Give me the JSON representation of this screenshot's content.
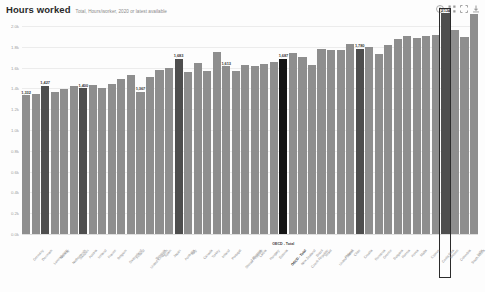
{
  "header": {
    "title": "Hours worked",
    "subtitle": "Total, Hours/worker, 2020 or latest available"
  },
  "toolbar": {
    "items": [
      {
        "name": "info-icon",
        "label": "Info"
      },
      {
        "name": "settings-icon",
        "label": "Settings"
      },
      {
        "name": "fullscreen-icon",
        "label": "Fullscreen"
      },
      {
        "name": "download-icon",
        "label": "Download"
      }
    ]
  },
  "annotations": {
    "oecd_marker": "OECD - Total",
    "selected_country": "Mexico"
  },
  "colors": {
    "bar": "#8e8e8e",
    "bar_highlight": "#4e4e4e",
    "bar_average": "#141414",
    "selection_border": "#2b2b2b",
    "grid": "#ececec",
    "axis_text": "#9d9d9d"
  },
  "chart_data": {
    "type": "bar",
    "title": "Hours worked",
    "subtitle": "Total, Hours/worker, 2020 or latest available",
    "xlabel": "",
    "ylabel": "Hours per worker",
    "ylim": [
      0,
      2000
    ],
    "grid": true,
    "legend": false,
    "ytick_labels": [
      "0.0k",
      "0.2k",
      "0.4k",
      "0.6k",
      "0.8k",
      "1.0k",
      "1.2k",
      "1.4k",
      "1.6k",
      "1.8k",
      "2.0k"
    ],
    "ytick_values": [
      0,
      200,
      400,
      600,
      800,
      1000,
      1200,
      1400,
      1600,
      1800,
      2000
    ],
    "categories": [
      "Germany",
      "Denmark",
      "Luxembourg",
      "Norway",
      "Netherlands",
      "Sweden",
      "Austria",
      "Iceland",
      "France",
      "Belgium",
      "Switzerland",
      "Finland",
      "United Kingdom",
      "Slovenia",
      "Spain",
      "Japan",
      "Australia",
      "Italy",
      "Canada",
      "Turkey",
      "Ireland",
      "Portugal",
      "Slovak Republic",
      "Lithuania",
      "Latvia",
      "Hungary",
      "Estonia",
      "OECD - Total",
      "New Zealand",
      "Czech Republic",
      "Brazil",
      "Israel",
      "United States",
      "Poland",
      "Chile",
      "Croatia",
      "Romania",
      "Greece",
      "Bulgaria",
      "Russia",
      "Korea",
      "Malta",
      "Cyprus",
      "Costa Rica",
      "Mexico",
      "Colombia",
      "South Africa",
      "India"
    ],
    "values": [
      1332,
      1346,
      1427,
      1369,
      1399,
      1424,
      1400,
      1435,
      1402,
      1441,
      1495,
      1531,
      1367,
      1514,
      1577,
      1598,
      1683,
      1559,
      1644,
      1572,
      1746,
      1613,
      1572,
      1622,
      1620,
      1632,
      1654,
      1687,
      1739,
      1705,
      1621,
      1783,
      1767,
      1766,
      1825,
      1780,
      1795,
      1728,
      1821,
      1874,
      1908,
      1882,
      1901,
      1913,
      2124,
      1964,
      1895,
      2117
    ],
    "highlight_indexes": [
      2,
      6,
      16,
      27,
      35,
      44
    ],
    "average_index": 27,
    "selected_index": 44,
    "labeled_points": [
      {
        "index": 0,
        "label": "1,332"
      },
      {
        "index": 2,
        "label": "1,427"
      },
      {
        "index": 6,
        "label": "1,400"
      },
      {
        "index": 12,
        "label": "1,367"
      },
      {
        "index": 16,
        "label": "1,683"
      },
      {
        "index": 21,
        "label": "1,613"
      },
      {
        "index": 27,
        "label": "1,687"
      },
      {
        "index": 35,
        "label": "1,780"
      },
      {
        "index": 44,
        "label": "2,124"
      }
    ]
  }
}
